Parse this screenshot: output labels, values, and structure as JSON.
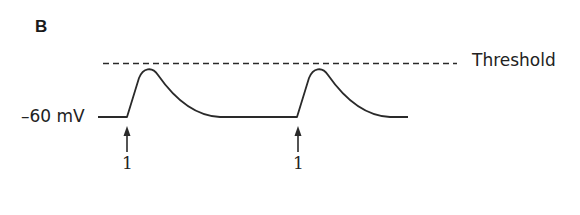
{
  "panel": {
    "label": "B"
  },
  "labels": {
    "threshold": "Threshold",
    "resting_potential": "–60 mV"
  },
  "stimuli": [
    {
      "label": "1",
      "x": 127
    },
    {
      "label": "1",
      "x": 298
    }
  ],
  "colors": {
    "trace": "#2a2a2a",
    "threshold_line": "#2a2a2a",
    "background": "#ffffff"
  }
}
